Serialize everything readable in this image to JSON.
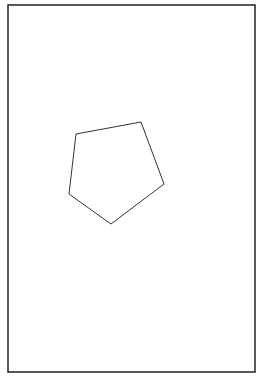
{
  "page": {
    "background": "#ffffff"
  },
  "frame": {
    "x": 8,
    "y": 5,
    "width": 247,
    "height": 367,
    "stroke": "#222222",
    "stroke_width": 1.5
  },
  "shape": {
    "type": "pentagon",
    "points": [
      [
        76,
        134
      ],
      [
        141,
        122
      ],
      [
        164,
        184
      ],
      [
        111,
        224
      ],
      [
        69,
        194
      ]
    ],
    "stroke": "#333333",
    "stroke_width": 1,
    "fill": "none"
  }
}
